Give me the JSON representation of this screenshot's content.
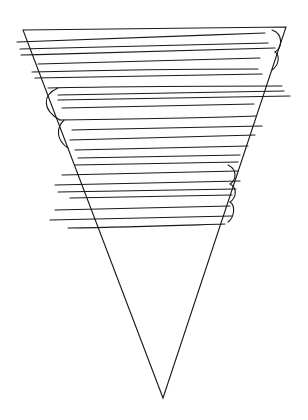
{
  "drawing": {
    "description": "hand-drawn inverted triangle with horizontal scribble hatching",
    "stroke_color": "#111111",
    "background": "#ffffff",
    "triangle": {
      "top_left": [
        22,
        30
      ],
      "top_right": [
        286,
        27
      ],
      "apex": [
        163,
        398
      ]
    }
  }
}
